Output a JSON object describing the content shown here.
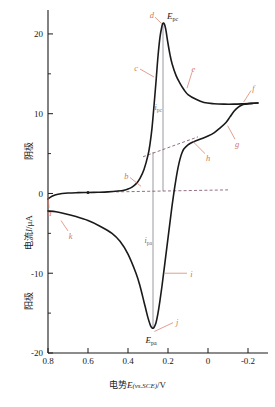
{
  "chart_data": {
    "type": "line",
    "title": "",
    "xlabel": "电势E(vs.SCE)/V",
    "ylabel": "电流I/μA",
    "ylabel_upper": "阴极",
    "ylabel_lower": "阳极",
    "xlim": [
      0.8,
      -0.3
    ],
    "ylim": [
      -20,
      23
    ],
    "x_ticks": [
      "0.8",
      "0.6",
      "0.4",
      "0.2",
      "0",
      "-0.2"
    ],
    "x_tick_values": [
      0.8,
      0.6,
      0.4,
      0.2,
      0,
      -0.2
    ],
    "y_ticks": [
      "20",
      "10",
      "0",
      "-10",
      "-20"
    ],
    "y_tick_values": [
      20,
      10,
      0,
      -10,
      -20
    ],
    "y_minor_ticks": [
      15,
      5,
      -5,
      -15
    ],
    "grid": false,
    "legend": "none",
    "curve_color": "#1a1a1a",
    "annotation_color": "#d4755f",
    "guide_color": "#6a6a7a",
    "series": [
      {
        "name": "forward-cathodic-scan",
        "comment": "scan from 0.8 V toward -0.25 V; current in microamps",
        "x": [
          0.8,
          0.78,
          0.75,
          0.7,
          0.65,
          0.6,
          0.55,
          0.5,
          0.45,
          0.42,
          0.4,
          0.38,
          0.36,
          0.34,
          0.32,
          0.3,
          0.29,
          0.28,
          0.27,
          0.26,
          0.25,
          0.24,
          0.23,
          0.225,
          0.22,
          0.215,
          0.21,
          0.2,
          0.19,
          0.18,
          0.16,
          0.14,
          0.12,
          0.1,
          0.06,
          0.02,
          -0.03,
          -0.08,
          -0.13,
          -0.18,
          -0.22,
          -0.25
        ],
        "y": [
          -0.7,
          -0.35,
          -0.1,
          0.05,
          0.1,
          0.12,
          0.15,
          0.2,
          0.3,
          0.4,
          0.55,
          0.8,
          1.2,
          1.9,
          3.0,
          4.8,
          6.2,
          8.2,
          11.0,
          14.0,
          17.2,
          19.6,
          21.0,
          21.35,
          21.3,
          21.0,
          20.4,
          18.8,
          17.4,
          16.3,
          14.8,
          13.8,
          13.0,
          12.4,
          11.8,
          11.4,
          11.25,
          11.2,
          11.2,
          11.25,
          11.3,
          11.35
        ]
      },
      {
        "name": "reverse-anodic-scan",
        "comment": "scan back from -0.25 V toward 0.8 V; current in microamps",
        "x": [
          -0.25,
          -0.22,
          -0.19,
          -0.17,
          -0.15,
          -0.13,
          -0.11,
          -0.09,
          -0.06,
          -0.03,
          0.0,
          0.03,
          0.06,
          0.08,
          0.1,
          0.12,
          0.13,
          0.14,
          0.15,
          0.16,
          0.17,
          0.18,
          0.19,
          0.2,
          0.21,
          0.22,
          0.23,
          0.24,
          0.25,
          0.26,
          0.27,
          0.275,
          0.28,
          0.285,
          0.29,
          0.3,
          0.31,
          0.32,
          0.34,
          0.36,
          0.4,
          0.44,
          0.48,
          0.54,
          0.6,
          0.66,
          0.72,
          0.76,
          0.8
        ],
        "y": [
          11.35,
          11.3,
          11.2,
          11.1,
          10.8,
          10.3,
          9.6,
          8.9,
          8.2,
          7.6,
          7.2,
          6.9,
          6.6,
          6.4,
          6.1,
          5.6,
          5.1,
          4.3,
          3.2,
          1.8,
          0.2,
          -1.6,
          -3.6,
          -5.6,
          -7.6,
          -9.6,
          -11.6,
          -13.4,
          -15.0,
          -16.2,
          -16.8,
          -16.9,
          -16.85,
          -16.7,
          -16.4,
          -15.6,
          -14.6,
          -13.6,
          -11.6,
          -10.0,
          -7.6,
          -6.0,
          -5.0,
          -4.1,
          -3.4,
          -2.9,
          -2.5,
          -2.3,
          -2.2
        ]
      }
    ],
    "peaks": [
      {
        "id": "Epc",
        "label": "E",
        "sub": "pc",
        "x": 0.225,
        "y": 21.35,
        "kind": "cathodic-peak"
      },
      {
        "id": "Epa",
        "label": "E",
        "sub": "pa",
        "x": 0.275,
        "y": -16.9,
        "kind": "anodic-peak"
      }
    ],
    "measurements": [
      {
        "id": "ipc",
        "label": "i",
        "sub": "pc",
        "x": 0.225,
        "from_y": 0.3,
        "to_y": 21.35
      },
      {
        "id": "ipa",
        "label": "i",
        "sub": "pa",
        "x": 0.275,
        "from_y": 5.2,
        "to_y": -16.9
      }
    ],
    "baselines": [
      {
        "id": "cathodic-baseline",
        "style": "dashed",
        "x0": 0.46,
        "y0": 0.2,
        "x1": -0.1,
        "y1": 0.45
      },
      {
        "id": "anodic-baseline",
        "style": "dashed",
        "x0": 0.325,
        "y0": 4.6,
        "x1": 0.05,
        "y1": 7.1
      }
    ],
    "annotations": [
      {
        "letter": "a",
        "x": 0.795,
        "y": -1.8,
        "tip_x": 0.8,
        "tip_y": -0.55
      },
      {
        "letter": "b",
        "x": 0.39,
        "y": 2.0,
        "tip_x": 0.335,
        "tip_y": 0.9
      },
      {
        "letter": "c",
        "x": 0.34,
        "y": 15.6,
        "tip_x": 0.27,
        "tip_y": 14.6
      },
      {
        "letter": "d",
        "x": 0.265,
        "y": 22.1,
        "tip_x": 0.232,
        "tip_y": 21.3
      },
      {
        "letter": "e",
        "x": 0.08,
        "y": 15.2,
        "tip_x": 0.105,
        "tip_y": 13.2
      },
      {
        "letter": "f",
        "x": -0.215,
        "y": 12.9,
        "tip_x": -0.178,
        "tip_y": 11.45
      },
      {
        "letter": "g",
        "x": -0.135,
        "y": 6.8,
        "tip_x": -0.098,
        "tip_y": 8.5
      },
      {
        "letter": "h",
        "x": 0.015,
        "y": 5.0,
        "tip_x": 0.075,
        "tip_y": 6.5
      },
      {
        "letter": "i",
        "x": 0.105,
        "y": -10.0,
        "tip_x": 0.215,
        "tip_y": -10.0
      },
      {
        "letter": "j",
        "x": 0.175,
        "y": -16.2,
        "tip_x": 0.268,
        "tip_y": -17.3
      },
      {
        "letter": "k",
        "x": 0.7,
        "y": -4.7,
        "tip_x": 0.735,
        "tip_y": -3.4
      }
    ]
  }
}
